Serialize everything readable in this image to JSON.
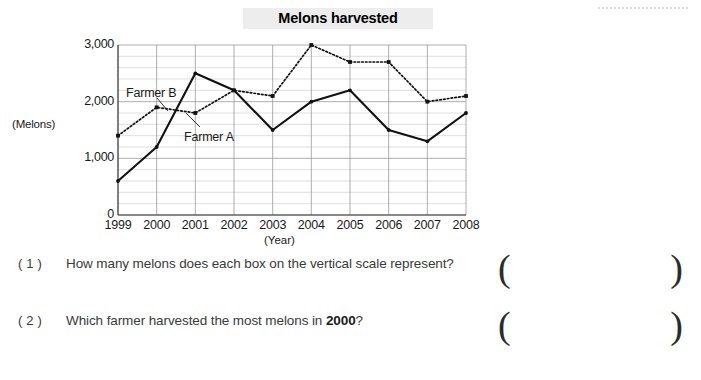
{
  "worksheet": {
    "title": "Melons harvested",
    "y_axis_caption": "(Melons)",
    "x_axis_caption": "(Year)",
    "questions": [
      {
        "number": "( 1 )",
        "text": "How many melons does each box on the vertical scale represent?",
        "answer_value": "",
        "paren_open": "(",
        "paren_close": ")"
      },
      {
        "number": "( 2 )",
        "text_before": "Which farmer harvested the most melons in ",
        "text_bold": "2000",
        "text_after": "?",
        "answer_value": "",
        "paren_open": "(",
        "paren_close": ")"
      }
    ]
  },
  "chart_data": {
    "type": "line",
    "title": "Melons harvested",
    "xlabel": "(Year)",
    "ylabel": "(Melons)",
    "categories": [
      "1999",
      "2000",
      "2001",
      "2002",
      "2003",
      "2004",
      "2005",
      "2006",
      "2007",
      "2008"
    ],
    "ylim": [
      0,
      3000
    ],
    "y_ticks": [
      0,
      1000,
      2000,
      3000
    ],
    "y_tick_labels": [
      "0",
      "1,000",
      "2,000",
      "3,000"
    ],
    "y_minor_step": 200,
    "grid": true,
    "legend": "inline-annotations",
    "series": [
      {
        "name": "Farmer A",
        "style": "solid",
        "color": "#111111",
        "values": [
          600,
          1200,
          2500,
          2200,
          1500,
          2000,
          2200,
          1500,
          1300,
          1800
        ]
      },
      {
        "name": "Farmer B",
        "style": "dotted",
        "color": "#111111",
        "values": [
          1400,
          1900,
          1800,
          2200,
          2100,
          3000,
          2700,
          2700,
          2000,
          2100
        ]
      }
    ],
    "annotations": [
      {
        "text": "Farmer B",
        "points_to_series": "Farmer B"
      },
      {
        "text": "Farmer A",
        "points_to_series": "Farmer A"
      }
    ]
  }
}
